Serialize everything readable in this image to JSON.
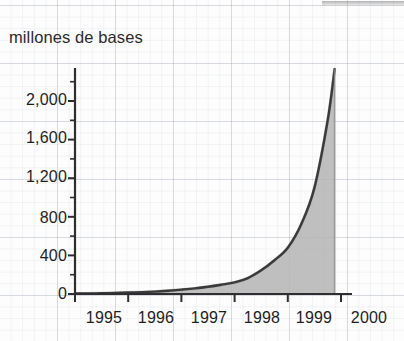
{
  "chart_data": {
    "type": "area",
    "title": "millones de bases",
    "title_lines": [
      "millones",
      "de bases"
    ],
    "xlabel": "",
    "ylabel": "millones de bases",
    "x": [
      1995,
      1996,
      1997,
      1998,
      1999,
      2000
    ],
    "categories": [
      "1995",
      "1996",
      "1997",
      "1998",
      "1999",
      "2000"
    ],
    "values": [
      5,
      15,
      45,
      120,
      480,
      2330
    ],
    "series": [
      {
        "name": "millones de bases",
        "values": [
          5,
          15,
          45,
          120,
          480,
          2330
        ]
      }
    ],
    "dense_x": [
      1995.0,
      1995.25,
      1995.5,
      1995.75,
      1996.0,
      1996.25,
      1996.5,
      1996.75,
      1997.0,
      1997.25,
      1997.5,
      1997.75,
      1998.0,
      1998.25,
      1998.5,
      1998.75,
      1999.0,
      1999.25,
      1999.5,
      1999.75,
      1999.88
    ],
    "dense_values": [
      5,
      6,
      8,
      11,
      15,
      19,
      25,
      34,
      45,
      58,
      75,
      96,
      120,
      165,
      245,
      350,
      480,
      720,
      1100,
      1800,
      2330
    ],
    "ylim": [
      0,
      2400
    ],
    "ytick_values": [
      0,
      400,
      800,
      1200,
      1600,
      2000
    ],
    "ytick_labels": [
      "0",
      "400",
      "800",
      "1,200",
      "1,600",
      "2,000"
    ],
    "yminor_values": [
      200,
      600,
      1000,
      1400,
      1800,
      2200
    ],
    "xlim": [
      1995,
      2000
    ],
    "grid": "graph-paper",
    "legend": "none",
    "fill_color": "#b4b4b4",
    "line_color": "#3a3a3a",
    "axis_color": "#2e2e2e",
    "grid_color": "#9aa4b0",
    "background_color": "#fdfdfd"
  }
}
